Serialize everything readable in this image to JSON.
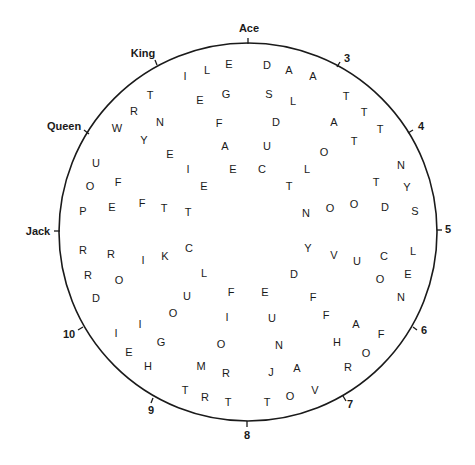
{
  "circle": {
    "cx": 248,
    "cy": 232,
    "r": 189,
    "stroke": "#1a1a1a"
  },
  "clock_labels": [
    {
      "text": "Ace",
      "x": 249,
      "y": 28,
      "tx1": 248,
      "ty1": 38,
      "tx2": 248,
      "ty2": 44
    },
    {
      "text": "3",
      "x": 347,
      "y": 58,
      "tx1": 340,
      "ty1": 62,
      "tx2": 337,
      "ty2": 67
    },
    {
      "text": "4",
      "x": 421,
      "y": 126,
      "tx1": 413,
      "ty1": 130,
      "tx2": 408,
      "ty2": 133
    },
    {
      "text": "5",
      "x": 448,
      "y": 229,
      "tx1": 437,
      "ty1": 230,
      "tx2": 442,
      "ty2": 230
    },
    {
      "text": "6",
      "x": 424,
      "y": 330,
      "tx1": 413,
      "ty1": 327,
      "tx2": 417,
      "ty2": 330
    },
    {
      "text": "7",
      "x": 350,
      "y": 404,
      "tx1": 343,
      "ty1": 396,
      "tx2": 346,
      "ty2": 401
    },
    {
      "text": "8",
      "x": 247,
      "y": 435,
      "tx1": 247,
      "ty1": 421,
      "tx2": 247,
      "ty2": 427
    },
    {
      "text": "9",
      "x": 151,
      "y": 410,
      "tx1": 153,
      "ty1": 398,
      "tx2": 151,
      "ty2": 403
    },
    {
      "text": "10",
      "x": 69,
      "y": 334,
      "tx1": 83,
      "ty1": 327,
      "tx2": 78,
      "ty2": 330
    },
    {
      "text": "Jack",
      "x": 38,
      "y": 231,
      "tx1": 54,
      "ty1": 231,
      "tx2": 60,
      "ty2": 231
    },
    {
      "text": "Queen",
      "x": 64,
      "y": 126,
      "tx1": 84,
      "ty1": 130,
      "tx2": 89,
      "ty2": 134
    },
    {
      "text": "King",
      "x": 143,
      "y": 53,
      "tx1": 155,
      "ty1": 60,
      "tx2": 157,
      "ty2": 65
    }
  ],
  "letters": [
    {
      "c": "I",
      "x": 185,
      "y": 76
    },
    {
      "c": "L",
      "x": 207,
      "y": 70
    },
    {
      "c": "E",
      "x": 229,
      "y": 64
    },
    {
      "c": "D",
      "x": 267,
      "y": 65
    },
    {
      "c": "A",
      "x": 289,
      "y": 70
    },
    {
      "c": "A",
      "x": 313,
      "y": 76
    },
    {
      "c": "T",
      "x": 150,
      "y": 95
    },
    {
      "c": "E",
      "x": 200,
      "y": 100
    },
    {
      "c": "G",
      "x": 226,
      "y": 94
    },
    {
      "c": "S",
      "x": 269,
      "y": 94
    },
    {
      "c": "L",
      "x": 293,
      "y": 101
    },
    {
      "c": "T",
      "x": 346,
      "y": 96
    },
    {
      "c": "R",
      "x": 134,
      "y": 111
    },
    {
      "c": "N",
      "x": 160,
      "y": 122
    },
    {
      "c": "F",
      "x": 219,
      "y": 123
    },
    {
      "c": "D",
      "x": 276,
      "y": 122
    },
    {
      "c": "A",
      "x": 334,
      "y": 122
    },
    {
      "c": "T",
      "x": 364,
      "y": 112
    },
    {
      "c": "W",
      "x": 117,
      "y": 128
    },
    {
      "c": "Y",
      "x": 144,
      "y": 140
    },
    {
      "c": "T",
      "x": 380,
      "y": 129
    },
    {
      "c": "E",
      "x": 170,
      "y": 154
    },
    {
      "c": "A",
      "x": 225,
      "y": 146
    },
    {
      "c": "U",
      "x": 267,
      "y": 146
    },
    {
      "c": "O",
      "x": 324,
      "y": 152
    },
    {
      "c": "T",
      "x": 354,
      "y": 141
    },
    {
      "c": "U",
      "x": 96,
      "y": 163
    },
    {
      "c": "I",
      "x": 188,
      "y": 169
    },
    {
      "c": "E",
      "x": 233,
      "y": 169
    },
    {
      "c": "C",
      "x": 262,
      "y": 169
    },
    {
      "c": "L",
      "x": 307,
      "y": 169
    },
    {
      "c": "N",
      "x": 401,
      "y": 165
    },
    {
      "c": "O",
      "x": 90,
      "y": 186
    },
    {
      "c": "F",
      "x": 118,
      "y": 182
    },
    {
      "c": "E",
      "x": 204,
      "y": 186
    },
    {
      "c": "T",
      "x": 289,
      "y": 186
    },
    {
      "c": "T",
      "x": 376,
      "y": 182
    },
    {
      "c": "Y",
      "x": 407,
      "y": 187
    },
    {
      "c": "P",
      "x": 83,
      "y": 211
    },
    {
      "c": "E",
      "x": 112,
      "y": 207
    },
    {
      "c": "F",
      "x": 142,
      "y": 203
    },
    {
      "c": "T",
      "x": 164,
      "y": 208
    },
    {
      "c": "T",
      "x": 188,
      "y": 212
    },
    {
      "c": "N",
      "x": 306,
      "y": 213
    },
    {
      "c": "O",
      "x": 330,
      "y": 208
    },
    {
      "c": "O",
      "x": 354,
      "y": 204
    },
    {
      "c": "D",
      "x": 385,
      "y": 207
    },
    {
      "c": "S",
      "x": 415,
      "y": 211
    },
    {
      "c": "R",
      "x": 83,
      "y": 250
    },
    {
      "c": "R",
      "x": 111,
      "y": 254
    },
    {
      "c": "I",
      "x": 143,
      "y": 260
    },
    {
      "c": "K",
      "x": 165,
      "y": 256
    },
    {
      "c": "C",
      "x": 189,
      "y": 248
    },
    {
      "c": "Y",
      "x": 308,
      "y": 248
    },
    {
      "c": "V",
      "x": 334,
      "y": 255
    },
    {
      "c": "U",
      "x": 357,
      "y": 261
    },
    {
      "c": "C",
      "x": 384,
      "y": 256
    },
    {
      "c": "L",
      "x": 413,
      "y": 251
    },
    {
      "c": "R",
      "x": 88,
      "y": 275
    },
    {
      "c": "O",
      "x": 119,
      "y": 280
    },
    {
      "c": "L",
      "x": 204,
      "y": 273
    },
    {
      "c": "D",
      "x": 294,
      "y": 274
    },
    {
      "c": "O",
      "x": 380,
      "y": 279
    },
    {
      "c": "E",
      "x": 408,
      "y": 274
    },
    {
      "c": "D",
      "x": 96,
      "y": 298
    },
    {
      "c": "U",
      "x": 187,
      "y": 296
    },
    {
      "c": "F",
      "x": 231,
      "y": 292
    },
    {
      "c": "E",
      "x": 265,
      "y": 292
    },
    {
      "c": "F",
      "x": 313,
      "y": 297
    },
    {
      "c": "N",
      "x": 401,
      "y": 297
    },
    {
      "c": "O",
      "x": 173,
      "y": 313
    },
    {
      "c": "I",
      "x": 227,
      "y": 317
    },
    {
      "c": "U",
      "x": 272,
      "y": 318
    },
    {
      "c": "F",
      "x": 326,
      "y": 315
    },
    {
      "c": "A",
      "x": 356,
      "y": 324
    },
    {
      "c": "I",
      "x": 140,
      "y": 324
    },
    {
      "c": "I",
      "x": 116,
      "y": 333
    },
    {
      "c": "G",
      "x": 161,
      "y": 342
    },
    {
      "c": "O",
      "x": 221,
      "y": 344
    },
    {
      "c": "N",
      "x": 279,
      "y": 345
    },
    {
      "c": "H",
      "x": 337,
      "y": 342
    },
    {
      "c": "F",
      "x": 381,
      "y": 334
    },
    {
      "c": "E",
      "x": 129,
      "y": 352
    },
    {
      "c": "O",
      "x": 366,
      "y": 353
    },
    {
      "c": "H",
      "x": 148,
      "y": 366
    },
    {
      "c": "M",
      "x": 201,
      "y": 366
    },
    {
      "c": "R",
      "x": 226,
      "y": 373
    },
    {
      "c": "J",
      "x": 271,
      "y": 372
    },
    {
      "c": "A",
      "x": 297,
      "y": 368
    },
    {
      "c": "R",
      "x": 348,
      "y": 367
    },
    {
      "c": "T",
      "x": 185,
      "y": 390
    },
    {
      "c": "R",
      "x": 205,
      "y": 397
    },
    {
      "c": "T",
      "x": 228,
      "y": 402
    },
    {
      "c": "T",
      "x": 267,
      "y": 402
    },
    {
      "c": "O",
      "x": 290,
      "y": 396
    },
    {
      "c": "V",
      "x": 315,
      "y": 390
    }
  ]
}
